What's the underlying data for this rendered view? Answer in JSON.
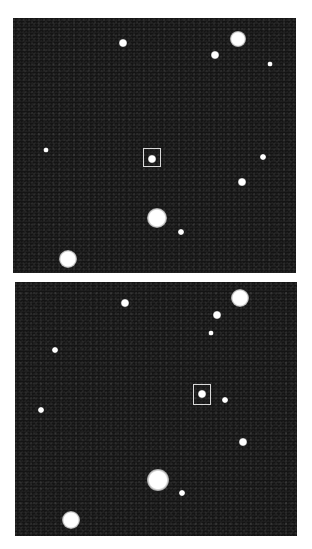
{
  "figure": {
    "colors": {
      "background": "#ffffff",
      "sky": "#141414",
      "star": "#ffffff",
      "marker": "#d8d8d8"
    },
    "panels": [
      {
        "id": "top",
        "bounds": {
          "x": 13,
          "y": 18,
          "w": 283,
          "h": 255
        },
        "marker": {
          "x": 143,
          "y": 148,
          "w": 18,
          "h": 19
        },
        "stars": [
          {
            "x": 238,
            "y": 39,
            "r": 7
          },
          {
            "x": 123,
            "y": 43,
            "r": 3
          },
          {
            "x": 215,
            "y": 55,
            "r": 3
          },
          {
            "x": 270,
            "y": 64,
            "r": 1.5
          },
          {
            "x": 46,
            "y": 150,
            "r": 1.5
          },
          {
            "x": 152,
            "y": 159,
            "r": 3
          },
          {
            "x": 263,
            "y": 157,
            "r": 2
          },
          {
            "x": 242,
            "y": 182,
            "r": 3
          },
          {
            "x": 157,
            "y": 218,
            "r": 9
          },
          {
            "x": 181,
            "y": 232,
            "r": 2
          },
          {
            "x": 68,
            "y": 259,
            "r": 8
          }
        ]
      },
      {
        "id": "bottom",
        "bounds": {
          "x": 15,
          "y": 282,
          "w": 282,
          "h": 254
        },
        "marker": {
          "x": 193,
          "y": 384,
          "w": 18,
          "h": 21
        },
        "stars": [
          {
            "x": 240,
            "y": 298,
            "r": 8
          },
          {
            "x": 125,
            "y": 303,
            "r": 3
          },
          {
            "x": 217,
            "y": 315,
            "r": 3
          },
          {
            "x": 211,
            "y": 333,
            "r": 1.5
          },
          {
            "x": 55,
            "y": 350,
            "r": 2
          },
          {
            "x": 41,
            "y": 410,
            "r": 2
          },
          {
            "x": 202,
            "y": 394,
            "r": 3
          },
          {
            "x": 225,
            "y": 400,
            "r": 2
          },
          {
            "x": 243,
            "y": 442,
            "r": 3
          },
          {
            "x": 158,
            "y": 480,
            "r": 10
          },
          {
            "x": 182,
            "y": 493,
            "r": 2
          },
          {
            "x": 71,
            "y": 520,
            "r": 8
          }
        ]
      }
    ]
  }
}
